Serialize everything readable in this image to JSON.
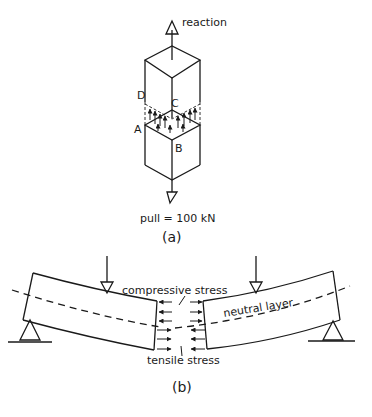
{
  "figure_a": {
    "caption": "(a)",
    "top_label": "reaction",
    "bottom_label": "pull = 100 kN",
    "corner_labels": {
      "D": "D",
      "C": "C",
      "A": "A",
      "B": "B"
    }
  },
  "figure_b": {
    "caption": "(b)",
    "compressive_label": "compressive stress",
    "tensile_label": "tensile stress",
    "neutral_label": "neutral layer"
  },
  "colors": {
    "ink": "#1a1a1a",
    "background": "#ffffff"
  }
}
